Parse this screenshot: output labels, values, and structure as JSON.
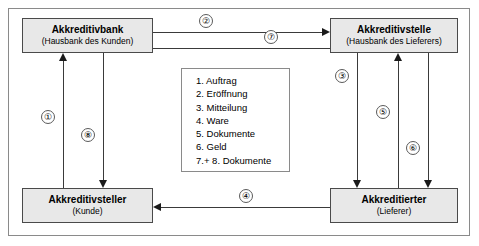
{
  "diagram": {
    "actors": [
      {
        "id": "akkreditivbank",
        "title": "Akkreditivbank",
        "subtitle": "(Hausbank des Kunden)"
      },
      {
        "id": "akkreditivstelle",
        "title": "Akkreditivstelle",
        "subtitle": "(Hausbank des Lieferers)"
      },
      {
        "id": "akkreditivsteller",
        "title": "Akkreditivsteller",
        "subtitle": "(Kunde)"
      },
      {
        "id": "akkreditierter",
        "title": "Akkreditierter",
        "subtitle": "(Lieferer)"
      }
    ],
    "legend": {
      "items": [
        "1. Auftrag",
        "2. Eröffnung",
        "3. Mitteilung",
        "4. Ware",
        "5. Dokumente",
        "6. Geld",
        "7.+ 8. Dokumente"
      ]
    },
    "steps": [
      {
        "number": "①",
        "name": "auftrag",
        "from": "akkreditivsteller",
        "to": "akkreditivbank",
        "direction": "up"
      },
      {
        "number": "②",
        "name": "eroeffnung",
        "from": "akkreditivbank",
        "to": "akkreditivstelle",
        "direction": "right"
      },
      {
        "number": "③",
        "name": "mitteilung",
        "from": "akkreditivstelle",
        "to": "akkreditierter",
        "direction": "down"
      },
      {
        "number": "④",
        "name": "ware",
        "from": "akkreditierter",
        "to": "akkreditivsteller",
        "direction": "left"
      },
      {
        "number": "⑤",
        "name": "dokumente",
        "from": "akkreditierter",
        "to": "akkreditivstelle",
        "direction": "up"
      },
      {
        "number": "⑥",
        "name": "geld",
        "from": "akkreditivstelle",
        "to": "akkreditierter",
        "direction": "down"
      },
      {
        "number": "⑦",
        "name": "dokumente-7",
        "from": "akkreditivstelle",
        "to": "akkreditivbank",
        "direction": "left"
      },
      {
        "number": "⑧",
        "name": "dokumente-8",
        "from": "akkreditivbank",
        "to": "akkreditivsteller",
        "direction": "down"
      }
    ],
    "colors": {
      "box_fill": "#e8e8e8",
      "box_border": "#4a4a4a",
      "line": "#3a3a3a",
      "frame": "#8a8a8a",
      "text": "#000000"
    }
  }
}
